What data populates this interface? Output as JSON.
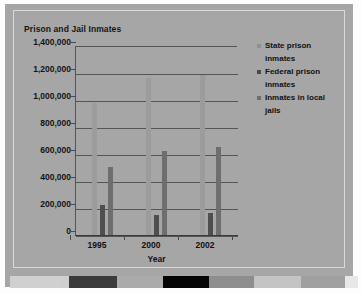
{
  "chart_data": {
    "type": "bar",
    "title": "Prison and Jail Inmates",
    "xlabel": "Year",
    "ylabel": "",
    "categories": [
      "1995",
      "2000",
      "2002"
    ],
    "ylim": [
      0,
      1400000
    ],
    "ytick_values": [
      1400000,
      1200000,
      1000000,
      800000,
      600000,
      400000,
      200000,
      0
    ],
    "ytick_labels": [
      "1,400,000",
      "1,200,000",
      "1,000,000",
      "800,000",
      "600,000",
      "400,000",
      "200,000",
      "0"
    ],
    "grid": true,
    "legend_position": "right",
    "series": [
      {
        "name": "State prison inmates",
        "color": "#9c9c9c",
        "values": [
          980000,
          1165000,
          1185000
        ]
      },
      {
        "name": "Federal prison inmates",
        "color": "#4f4f4f",
        "values": [
          220000,
          145000,
          160000
        ]
      },
      {
        "name": "Inmates in local jails",
        "color": "#6e6e6e",
        "values": [
          505000,
          620000,
          650000
        ]
      }
    ]
  },
  "legend": {
    "items": [
      {
        "label_line1": "State prison",
        "label_line2": "inmates",
        "color": "#8f8f8f"
      },
      {
        "label_line1": "Federal prison",
        "label_line2": "inmates",
        "color": "#4a4a4a"
      },
      {
        "label_line1": "Inmates in local",
        "label_line2": "jails",
        "color": "#6e6e6e"
      }
    ]
  },
  "strip": {
    "segments": [
      {
        "color": "#d0d0d0",
        "width": 51
      },
      {
        "color": "#cfcfcf",
        "width": 8
      },
      {
        "color": "#3b3b3b",
        "width": 48
      },
      {
        "color": "#ababab",
        "width": 46
      },
      {
        "color": "#050505",
        "width": 46
      },
      {
        "color": "#8e8e8e",
        "width": 45
      },
      {
        "color": "#c3c3c3",
        "width": 47
      },
      {
        "color": "#a0a0a0",
        "width": 44
      },
      {
        "color": "#e8e8e8",
        "width": 13
      }
    ]
  },
  "colors": {
    "slide_background": "#a6a6a6",
    "page_background": "#fdfdfd",
    "axis": "#555555",
    "text": "#111111"
  }
}
